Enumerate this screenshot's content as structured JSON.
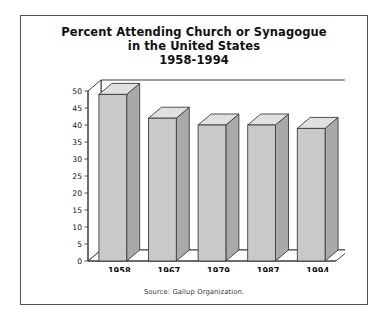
{
  "figure": {
    "title_lines": [
      "Percent Attending Church or Synagogue",
      "in the United States",
      "1958-1994"
    ],
    "source_note": "Source: Gallup Organization.",
    "border_color": "#555555",
    "background_color": "#ffffff"
  },
  "chart_data": {
    "type": "bar",
    "title": "Percent Attending Church or Synagogue in the United States 1958-1994",
    "subtitle": "in the United States",
    "period": "1958-1994",
    "categories": [
      "1958",
      "1967",
      "1979",
      "1987",
      "1994"
    ],
    "values": [
      49,
      42,
      40,
      40,
      39
    ],
    "xlabel": "",
    "ylabel": "",
    "ylim": [
      0,
      50
    ],
    "ytick_step": 5,
    "yticks": [
      0,
      5,
      10,
      15,
      20,
      25,
      30,
      35,
      40,
      45,
      50
    ],
    "ytick_labels": [
      "0",
      "5",
      "10",
      "15",
      "20",
      "25",
      "30",
      "35",
      "40",
      "45",
      "50"
    ],
    "grid": false,
    "legend": false,
    "style": "3d-isometric-columns",
    "series_name": "Percent attending",
    "bar_fill_color": "#c9c9c9",
    "bar_top_color": "#e0e0e0",
    "bar_side_color": "#a9a9a9",
    "bar_edge_color": "#3d3d3d",
    "annotation": "Source: Gallup Organization."
  }
}
